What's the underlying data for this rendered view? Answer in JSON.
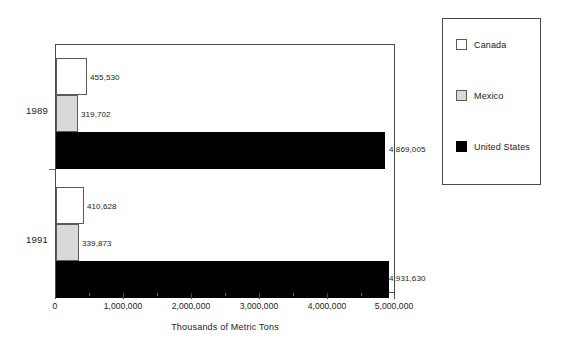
{
  "chart_data": {
    "type": "bar",
    "orientation": "horizontal",
    "title": "",
    "xlabel": "Thousands of Metric Tons",
    "ylabel": "",
    "categories": [
      "1989",
      "1991"
    ],
    "series": [
      {
        "name": "Canada",
        "color": "#ffffff",
        "values": [
          455530,
          410628
        ],
        "labels": [
          "455,530",
          "410,628"
        ]
      },
      {
        "name": "Mexico",
        "color": "#d9d9d9",
        "values": [
          319702,
          339873
        ],
        "labels": [
          "319,702",
          "339,873"
        ]
      },
      {
        "name": "United States",
        "color": "#000000",
        "values": [
          4869005,
          4931630
        ],
        "labels": [
          "4,869,005",
          "4,931,630"
        ]
      }
    ],
    "xlim": [
      0,
      5000000
    ],
    "xticks": [
      0,
      1000000,
      2000000,
      3000000,
      4000000,
      5000000
    ],
    "xtick_labels": [
      "0",
      "1,000,000",
      "2,000,000",
      "3,000,000",
      "4,000,000",
      "5,000,000"
    ],
    "minor_ticks_between": 1,
    "grid": false,
    "legend_position": "right",
    "legend_entries": [
      "Canada",
      "Mexico",
      "United States"
    ]
  },
  "axis": {
    "title": "Thousands of Metric Tons",
    "ticks": [
      {
        "label": "0"
      },
      {
        "label": "1,000,000"
      },
      {
        "label": "2,000,000"
      },
      {
        "label": "3,000,000"
      },
      {
        "label": "4,000,000"
      },
      {
        "label": "5,000,000"
      }
    ]
  },
  "groups": [
    {
      "year": "1989",
      "bars": [
        {
          "series": "Canada",
          "value": 455530,
          "label": "455,530"
        },
        {
          "series": "Mexico",
          "value": 319702,
          "label": "319,702"
        },
        {
          "series": "United States",
          "value": 4869005,
          "label": "4,869,005"
        }
      ]
    },
    {
      "year": "1991",
      "bars": [
        {
          "series": "Canada",
          "value": 410628,
          "label": "410,628"
        },
        {
          "series": "Mexico",
          "value": 339873,
          "label": "339,873"
        },
        {
          "series": "United States",
          "value": 4931630,
          "label": "4,931,630"
        }
      ]
    }
  ],
  "legend": {
    "items": [
      {
        "label": "Canada",
        "color": "#ffffff"
      },
      {
        "label": "Mexico",
        "color": "#d9d9d9"
      },
      {
        "label": "United States",
        "color": "#000000"
      }
    ]
  }
}
